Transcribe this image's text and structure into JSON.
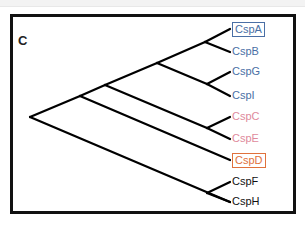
{
  "panel": {
    "label": "C"
  },
  "colors": {
    "blue": "#4a6fa5",
    "pink": "#e08a9c",
    "orange": "#e0713c",
    "black": "#111111",
    "edge": "#000000"
  },
  "tree": {
    "nodes": {
      "root": [
        30,
        117
      ],
      "n1": [
        80,
        96
      ],
      "n2": [
        105,
        85
      ],
      "n3": [
        157,
        63
      ],
      "nAB": [
        205,
        42
      ],
      "nGI": [
        207,
        84
      ],
      "nCE": [
        207,
        128
      ],
      "nFH": [
        207,
        193
      ]
    },
    "leaves": [
      {
        "label": "CspA",
        "color": "blue",
        "boxed": true,
        "tip": [
          230,
          29
        ]
      },
      {
        "label": "CspB",
        "color": "blue",
        "boxed": false,
        "tip": [
          230,
          52
        ]
      },
      {
        "label": "CspG",
        "color": "blue",
        "boxed": false,
        "tip": [
          230,
          72
        ]
      },
      {
        "label": "CspI",
        "color": "blue",
        "boxed": false,
        "tip": [
          230,
          96
        ]
      },
      {
        "label": "CspC",
        "color": "pink",
        "boxed": false,
        "tip": [
          230,
          117
        ]
      },
      {
        "label": "CspE",
        "color": "pink",
        "boxed": false,
        "tip": [
          230,
          139
        ]
      },
      {
        "label": "CspD",
        "color": "orange",
        "boxed": true,
        "tip": [
          230,
          160
        ]
      },
      {
        "label": "CspF",
        "color": "black",
        "boxed": false,
        "tip": [
          230,
          182
        ]
      },
      {
        "label": "CspH",
        "color": "black",
        "boxed": false,
        "tip": [
          230,
          202
        ]
      }
    ]
  }
}
